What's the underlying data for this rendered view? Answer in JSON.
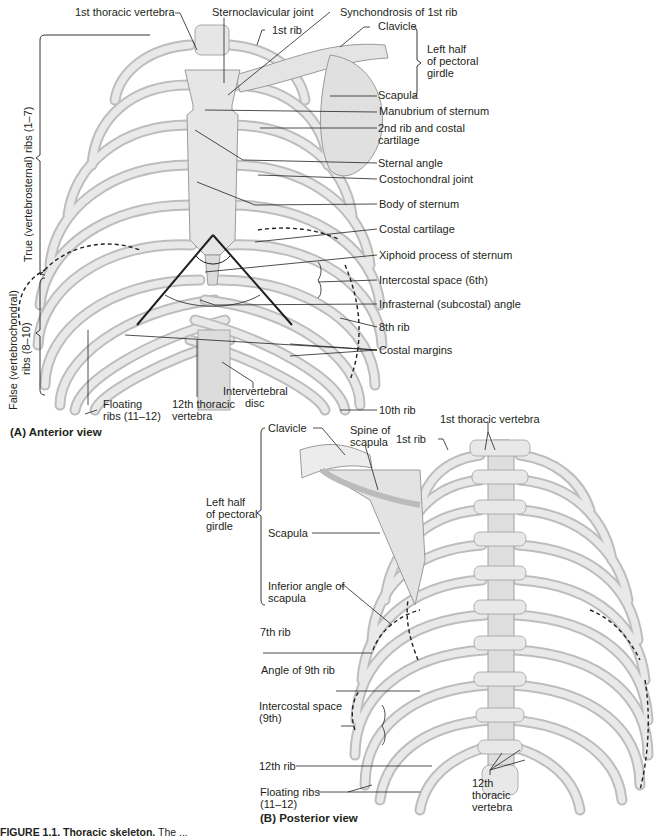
{
  "figure": {
    "caption_label": "FIGURE 1.1.",
    "caption_title": "Thoracic skeleton.",
    "caption_text": "The ..."
  },
  "anterior": {
    "title": "(A) Anterior view",
    "labels": {
      "first_thoracic_vertebra": "1st thoracic vertebra",
      "sternoclavicular_joint": "Sternoclavicular joint",
      "synchondrosis": "Synchondrosis of 1st rib",
      "first_rib": "1st rib",
      "clavicle": "Clavicle",
      "pectoral_girdle_1": "Left half",
      "pectoral_girdle_2": "of pectoral",
      "pectoral_girdle_3": "girdle",
      "scapula": "Scapula",
      "manubrium": "Manubrium of sternum",
      "second_rib_1": "2nd rib and costal",
      "second_rib_2": "cartilage",
      "sternal_angle": "Sternal angle",
      "costochondral_joint": "Costochondral joint",
      "body_of_sternum": "Body of sternum",
      "costal_cartilage": "Costal cartilage",
      "xiphoid": "Xiphoid process of sternum",
      "intercostal_space": "Intercostal space (6th)",
      "infrasternal_angle": "Infrasternal (subcostal) angle",
      "eighth_rib": "8th rib",
      "costal_margins": "Costal margins",
      "tenth_rib": "10th rib",
      "intervertebral_disc_1": "Intervertebral",
      "intervertebral_disc_2": "disc",
      "twelfth_vertebra_1": "12th thoracic",
      "twelfth_vertebra_2": "vertebra",
      "floating_ribs_1": "Floating",
      "floating_ribs_2": "ribs (11–12)",
      "true_ribs": "True (vertebrosternal) ribs (1–7)",
      "false_ribs_1": "False (vertebrochondral)",
      "false_ribs_2": "ribs (8–10)"
    }
  },
  "posterior": {
    "title": "(B)  Posterior view",
    "labels": {
      "clavicle": "Clavicle",
      "spine_of_scapula_1": "Spine of",
      "spine_of_scapula_2": "scapula",
      "first_rib": "1st rib",
      "first_thoracic_vertebra": "1st thoracic vertebra",
      "pectoral_girdle_1": "Left half",
      "pectoral_girdle_2": "of pectoral",
      "pectoral_girdle_3": "girdle",
      "scapula": "Scapula",
      "inferior_angle_1": "Inferior angle of",
      "inferior_angle_2": "scapula",
      "seventh_rib": "7th rib",
      "angle_ninth_rib": "Angle of 9th rib",
      "intercostal_space_1": "Intercostal space",
      "intercostal_space_2": "(9th)",
      "twelfth_rib": "12th rib",
      "floating_ribs_1": "Floating ribs",
      "floating_ribs_2": "(11–12)",
      "twelfth_vertebra_1": "12th",
      "twelfth_vertebra_2": "thoracic",
      "twelfth_vertebra_3": "vertebra"
    }
  }
}
